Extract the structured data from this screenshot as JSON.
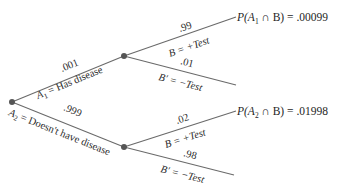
{
  "diagram": {
    "type": "probability-tree",
    "colors": {
      "line": "#6a6a6a",
      "node": "#555555",
      "text": "#2a2a2a"
    },
    "first_level": [
      {
        "prob": ".001",
        "label": "A",
        "sub": "1",
        "desc": " = Has disease"
      },
      {
        "prob": ".999",
        "label": "A",
        "sub": "2",
        "desc": " = Doesn't have disease"
      }
    ],
    "second_level_upper": [
      {
        "prob": ".99",
        "label": "B = +Test"
      },
      {
        "prob": ".01",
        "label": "B′ = −Test"
      }
    ],
    "second_level_lower": [
      {
        "prob": ".02",
        "label": "B = +Test"
      },
      {
        "prob": ".98",
        "label": "B′ = −Test"
      }
    ],
    "results": [
      {
        "prefix": "P(A",
        "sub": "1",
        "suffix": " ∩ B) = .00099"
      },
      {
        "prefix": "P(A",
        "sub": "2",
        "suffix": " ∩ B) = .01998"
      }
    ]
  }
}
